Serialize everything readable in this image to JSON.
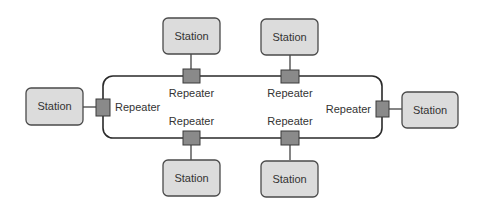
{
  "diagram": {
    "type": "ring-network",
    "colors": {
      "station_fill": "#dcdcdc",
      "station_stroke": "#4a4a4a",
      "repeater_fill": "#8a8a8a",
      "ring": "#2a2a2a",
      "background": "#ffffff"
    },
    "stations": [
      {
        "id": "top-left",
        "label": "Station"
      },
      {
        "id": "top-right",
        "label": "Station"
      },
      {
        "id": "left",
        "label": "Station"
      },
      {
        "id": "right",
        "label": "Station"
      },
      {
        "id": "bottom-left",
        "label": "Station"
      },
      {
        "id": "bottom-right",
        "label": "Station"
      }
    ],
    "repeaters": [
      {
        "id": "top-left",
        "label": "Repeater"
      },
      {
        "id": "top-right",
        "label": "Repeater"
      },
      {
        "id": "left",
        "label": "Repeater"
      },
      {
        "id": "right",
        "label": "Repeater"
      },
      {
        "id": "bottom-left",
        "label": "Repeater"
      },
      {
        "id": "bottom-right",
        "label": "Repeater"
      }
    ]
  }
}
